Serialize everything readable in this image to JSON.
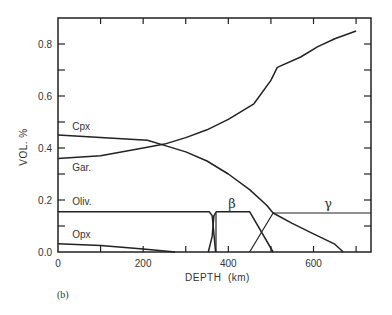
{
  "chart_data": {
    "type": "line",
    "title": "",
    "panel_label": "(b)",
    "xlabel": "DEPTH  (km)",
    "ylabel": "VOL. %",
    "xlim": [
      0,
      735
    ],
    "ylim": [
      0,
      0.9
    ],
    "grid": false,
    "x_ticks": [
      0,
      100,
      200,
      300,
      400,
      500,
      600,
      700
    ],
    "x_tick_labels": [
      "0",
      "200",
      "400",
      "600"
    ],
    "x_tick_label_values": [
      0,
      200,
      400,
      600
    ],
    "y_ticks": [
      0.0,
      0.1,
      0.2,
      0.3,
      0.4,
      0.5,
      0.6,
      0.7,
      0.8
    ],
    "y_tick_labels": [
      "0.0",
      "0.2",
      "0.4",
      "0.6",
      "0.8"
    ],
    "y_tick_label_values": [
      0.0,
      0.2,
      0.4,
      0.6,
      0.8
    ],
    "series": [
      {
        "name": "Cpx",
        "label": "Cpx",
        "label_pos": [
          10,
          0.47
        ],
        "points": [
          [
            0,
            0.45
          ],
          [
            100,
            0.44
          ],
          [
            210,
            0.43
          ],
          [
            250,
            0.41
          ],
          [
            300,
            0.385
          ],
          [
            350,
            0.35
          ],
          [
            400,
            0.3
          ],
          [
            450,
            0.24
          ],
          [
            490,
            0.18
          ],
          [
            505,
            0.15
          ],
          [
            550,
            0.11
          ],
          [
            600,
            0.07
          ],
          [
            650,
            0.03
          ],
          [
            670,
            0.0
          ]
        ]
      },
      {
        "name": "Gar.",
        "label": "Gar.",
        "label_pos": [
          10,
          0.31
        ],
        "points": [
          [
            0,
            0.36
          ],
          [
            100,
            0.37
          ],
          [
            200,
            0.4
          ],
          [
            250,
            0.415
          ],
          [
            300,
            0.44
          ],
          [
            350,
            0.47
          ],
          [
            400,
            0.51
          ],
          [
            460,
            0.57
          ],
          [
            500,
            0.66
          ],
          [
            515,
            0.71
          ],
          [
            570,
            0.75
          ],
          [
            610,
            0.79
          ],
          [
            650,
            0.82
          ],
          [
            700,
            0.85
          ]
        ]
      },
      {
        "name": "Oliv.",
        "label": "Oliv.",
        "label_pos": [
          10,
          0.18
        ],
        "points": [
          [
            0,
            0.155
          ],
          [
            355,
            0.155
          ],
          [
            362,
            0.14
          ],
          [
            366,
            0.07
          ],
          [
            370,
            0.0
          ]
        ]
      },
      {
        "name": "β",
        "label": "β",
        "label_pos": [
          400,
          0.17
        ],
        "points": [
          [
            353,
            0.0
          ],
          [
            362,
            0.06
          ],
          [
            366,
            0.14
          ],
          [
            372,
            0.155
          ],
          [
            450,
            0.155
          ],
          [
            505,
            0.0
          ]
        ]
      },
      {
        "name": "β-rise",
        "label": "",
        "label_pos": null,
        "points": [
          [
            371,
            0.0
          ],
          [
            371,
            0.15
          ]
        ]
      },
      {
        "name": "γ",
        "label": "γ",
        "label_pos": [
          625,
          0.17
        ],
        "points": [
          [
            450,
            0.0
          ],
          [
            505,
            0.15
          ],
          [
            735,
            0.15
          ]
        ]
      },
      {
        "name": "Opx",
        "label": "Opx",
        "label_pos": [
          10,
          0.055
        ],
        "points": [
          [
            0,
            0.032
          ],
          [
            100,
            0.025
          ],
          [
            200,
            0.012
          ],
          [
            275,
            0.0
          ]
        ]
      }
    ]
  }
}
